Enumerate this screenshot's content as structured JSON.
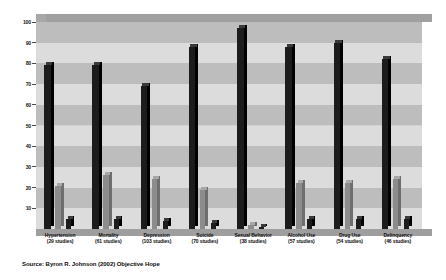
{
  "chart_data": {
    "type": "bar",
    "title": "",
    "subtitle": "",
    "xlabel": "",
    "ylabel": "",
    "ylim": [
      0,
      100
    ],
    "grid": true,
    "legend_position": "none",
    "categories": [
      "Hypertension",
      "Mortality",
      "Depression",
      "Suicide",
      "Sexual Behavior",
      "Alcohol Use",
      "Drug Use",
      "Delinquency"
    ],
    "category_sublabels": [
      "(29 studies)",
      "(61 studies)",
      "(103 studies)",
      "(70 studies)",
      "(38 studies)",
      "(57 studies)",
      "(54 studies)",
      "(46 studies)"
    ],
    "series": [
      {
        "name": "Beneficial",
        "color": "#1c1c1c",
        "values": [
          79,
          79,
          69,
          88,
          97,
          88,
          90,
          82
        ]
      },
      {
        "name": "No association",
        "color": "#8c8c8c",
        "values": [
          21,
          26,
          24,
          19,
          2,
          22,
          22,
          24
        ]
      },
      {
        "name": "Harmful",
        "color": "#1c1c1c",
        "values": [
          5,
          5,
          4,
          3,
          1,
          5,
          5,
          5
        ]
      }
    ],
    "y_ticks": [
      {
        "value": 100,
        "label": "100"
      },
      {
        "value": 90,
        "label": "90"
      },
      {
        "value": 80,
        "label": "80"
      },
      {
        "value": 70,
        "label": "70"
      },
      {
        "value": 60,
        "label": "60"
      },
      {
        "value": 50,
        "label": "50"
      },
      {
        "value": 40,
        "label": "40"
      },
      {
        "value": 30,
        "label": "30"
      },
      {
        "value": 20,
        "label": "20"
      },
      {
        "value": 10,
        "label": "10"
      }
    ],
    "source": "Source: Byron R. Johnson (2002) Objective Hope"
  }
}
